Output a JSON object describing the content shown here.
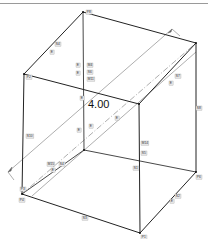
{
  "header": {
    "title": ""
  },
  "diagram": {
    "type": "cube-wireframe",
    "dimension_label": "4.00",
    "colors": {
      "edge": "#333333",
      "hidden_edge": "#555555",
      "dim_line": "#777777",
      "tag_bg": "#e6e6e6",
      "tag_text": "#333333"
    },
    "vertices": {
      "top_back": [
        83,
        12
      ],
      "top_right": [
        196,
        43
      ],
      "top_left": [
        24,
        74
      ],
      "top_front": [
        139,
        104
      ],
      "bottom_back": [
        84,
        150
      ],
      "bottom_right": [
        196,
        172
      ],
      "bottom_left": [
        22,
        194
      ],
      "bottom_front": [
        140,
        233
      ]
    },
    "tags": [
      {
        "label": "P8",
        "x": 86,
        "y": 10
      },
      {
        "label": "S4",
        "x": 55,
        "y": 42
      },
      {
        "label": "E",
        "x": 50,
        "y": 50
      },
      {
        "label": "E",
        "x": 76,
        "y": 63
      },
      {
        "label": "E",
        "x": 76,
        "y": 71
      },
      {
        "label": "M4",
        "x": 87,
        "y": 63
      },
      {
        "label": "S6",
        "x": 87,
        "y": 70
      },
      {
        "label": "M11",
        "x": 87,
        "y": 77
      },
      {
        "label": "P2",
        "x": 26,
        "y": 75
      },
      {
        "label": "S7",
        "x": 175,
        "y": 74
      },
      {
        "label": "E",
        "x": 169,
        "y": 81
      },
      {
        "label": "S8",
        "x": 196,
        "y": 106
      },
      {
        "label": "E",
        "x": 80,
        "y": 96
      },
      {
        "label": "S10",
        "x": 26,
        "y": 134
      },
      {
        "label": "E",
        "x": 77,
        "y": 128
      },
      {
        "label": "E",
        "x": 89,
        "y": 124
      },
      {
        "label": "E",
        "x": 115,
        "y": 116
      },
      {
        "label": "M14",
        "x": 141,
        "y": 141
      },
      {
        "label": "S5",
        "x": 141,
        "y": 151
      },
      {
        "label": "M15",
        "x": 47,
        "y": 162
      },
      {
        "label": "S4",
        "x": 59,
        "y": 162
      },
      {
        "label": "E",
        "x": 51,
        "y": 168
      },
      {
        "label": "S1",
        "x": 133,
        "y": 166
      },
      {
        "label": "P3",
        "x": 20,
        "y": 187
      },
      {
        "label": "P4",
        "x": 19,
        "y": 198
      },
      {
        "label": "S2",
        "x": 175,
        "y": 194
      },
      {
        "label": "E",
        "x": 170,
        "y": 199
      },
      {
        "label": "P6",
        "x": 196,
        "y": 175
      },
      {
        "label": "S3",
        "x": 82,
        "y": 216
      },
      {
        "label": "P1",
        "x": 141,
        "y": 235
      }
    ]
  }
}
